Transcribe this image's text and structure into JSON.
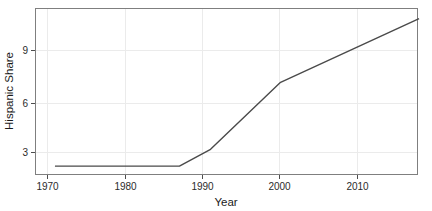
{
  "chart_data": {
    "type": "line",
    "title": "",
    "xlabel": "Year",
    "ylabel": "Hispanic Share",
    "xlim": [
      1968.5,
      2017.6
    ],
    "ylim": [
      1.6,
      11.5
    ],
    "xticks": [
      1970,
      1980,
      1990,
      2000,
      2010
    ],
    "xtick_labels": [
      "1970",
      "1980",
      "1990",
      "2000",
      "2010"
    ],
    "yticks": [
      3,
      6,
      9
    ],
    "ytick_labels": [
      "3",
      "6",
      "9"
    ],
    "grid": true,
    "legend": "none",
    "line_color": "#4a4a4a",
    "grid_color": "#ebebeb",
    "panel_border_color": "#7f7f7f",
    "series": [
      {
        "name": "Hispanic Share",
        "x": [
          1971.0,
          1987.0,
          1991.0,
          2000.0,
          2017.8
        ],
        "values": [
          2.1,
          2.1,
          3.1,
          7.1,
          10.9
        ]
      }
    ]
  },
  "labels": {
    "x_axis_title": "Year",
    "y_axis_title": "Hispanic Share"
  }
}
